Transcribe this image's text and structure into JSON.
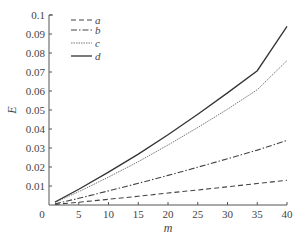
{
  "chart_data": {
    "type": "line",
    "title": "",
    "xlabel": "m",
    "ylabel": "E",
    "xlim": [
      0,
      40
    ],
    "ylim": [
      0,
      0.1
    ],
    "xticks": [
      0,
      5,
      10,
      15,
      20,
      25,
      30,
      35,
      40
    ],
    "xtick_labels": [
      "0",
      "5",
      "10",
      "15",
      "20",
      "25",
      "30",
      "35",
      "40"
    ],
    "yticks": [
      0.01,
      0.02,
      0.03,
      0.04,
      0.05,
      0.06,
      0.07,
      0.08,
      0.09,
      0.1
    ],
    "ytick_labels": [
      "0.01",
      "0.02",
      "0.03",
      "0.04",
      "0.05",
      "0.06",
      "0.07",
      "0.08",
      "0.09",
      "0.1"
    ],
    "grid": false,
    "legend_position": "upper-left",
    "x": [
      1,
      5,
      10,
      15,
      20,
      25,
      30,
      35,
      40
    ],
    "series": [
      {
        "name": "a",
        "style": "dashed",
        "values": [
          0.0003,
          0.0015,
          0.003,
          0.0046,
          0.0063,
          0.0079,
          0.0096,
          0.0113,
          0.013
        ]
      },
      {
        "name": "b",
        "style": "dashdot",
        "values": [
          0.0006,
          0.0035,
          0.0074,
          0.0114,
          0.0156,
          0.0199,
          0.0243,
          0.0289,
          0.034
        ]
      },
      {
        "name": "c",
        "style": "dotted",
        "values": [
          0.0014,
          0.007,
          0.0147,
          0.0228,
          0.0316,
          0.0408,
          0.0504,
          0.0607,
          0.076
        ]
      },
      {
        "name": "d",
        "style": "solid",
        "values": [
          0.0016,
          0.0083,
          0.0173,
          0.0268,
          0.037,
          0.0478,
          0.059,
          0.0707,
          0.094
        ]
      }
    ]
  }
}
